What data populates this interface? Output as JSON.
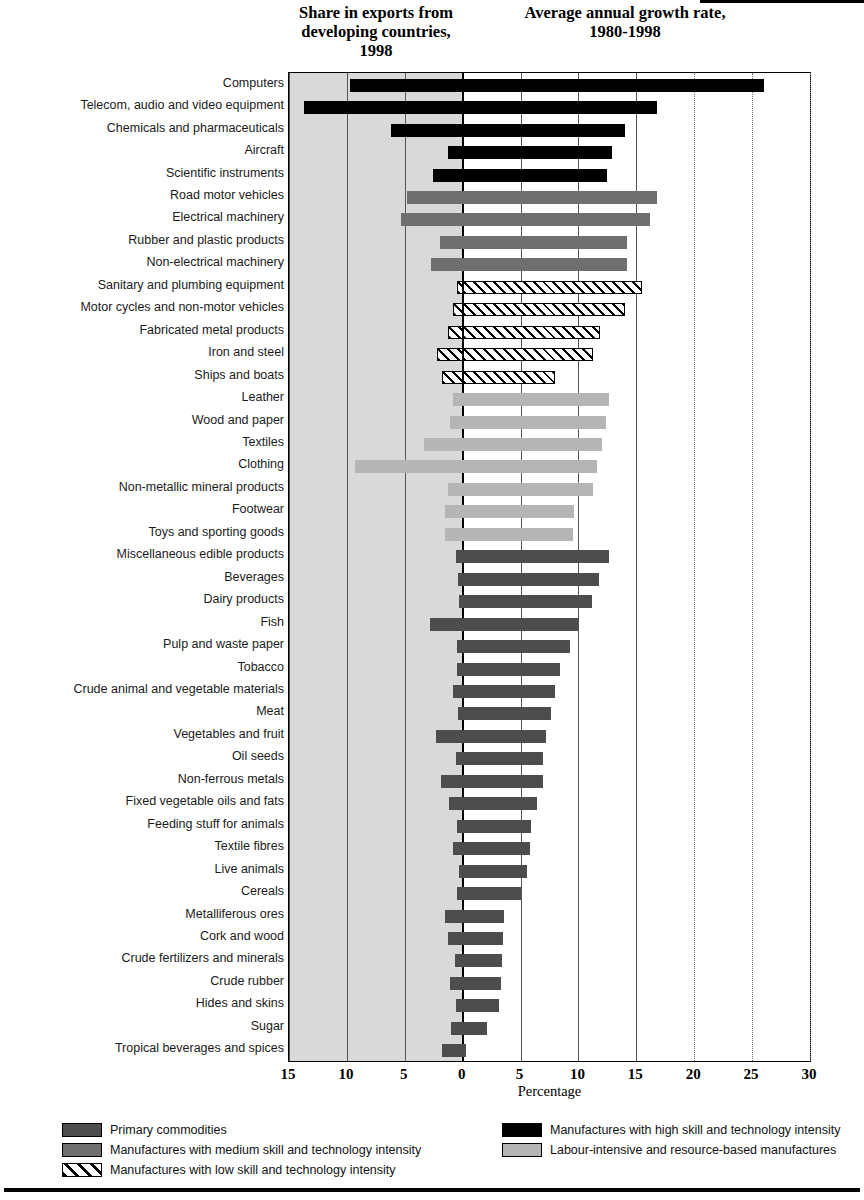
{
  "header": {
    "left_title": "Share in exports from developing countries, 1998",
    "right_title": "Average annual growth rate, 1980-1998"
  },
  "axis": {
    "x_title": "Percentage",
    "ticks": [
      "15",
      "10",
      "5",
      "0",
      "5",
      "10",
      "15",
      "20",
      "25",
      "30"
    ]
  },
  "legend": {
    "items": [
      {
        "label": "Primary commodities",
        "key": "primary",
        "color": "#4d4d4d"
      },
      {
        "label": "Manufactures with high skill and technology intensity",
        "key": "high",
        "color": "#000000"
      },
      {
        "label": "Manufactures with medium skill and technology intensity",
        "key": "medium",
        "color": "#6f6f6f"
      },
      {
        "label": "Labour-intensive and resource-based manufactures",
        "key": "labour",
        "color": "#b5b5b5"
      },
      {
        "label": "Manufactures with low skill and technology intensity",
        "key": "low",
        "color": "#ffffff"
      }
    ]
  },
  "chart_data": {
    "type": "bar",
    "orientation": "horizontal",
    "xlabel": "Percentage",
    "ylabel": "",
    "xlim": [
      -15,
      30
    ],
    "grid": true,
    "legend_position": "bottom",
    "note": "Bars extending left of 0 show share in exports (1998); bars extending right of 0 show average annual growth rate 1980-1998.",
    "categories": [
      "Computers",
      "Telecom, audio and video equipment",
      "Chemicals and pharmaceuticals",
      "Aircraft",
      "Scientific instruments",
      "Road motor vehicles",
      "Electrical machinery",
      "Rubber and plastic products",
      "Non-electrical machinery",
      "Sanitary and plumbing equipment",
      "Motor cycles and non-motor vehicles",
      "Fabricated metal products",
      "Iron and steel",
      "Ships and boats",
      "Leather",
      "Wood and paper",
      "Textiles",
      "Clothing",
      "Non-metallic mineral products",
      "Footwear",
      "Toys and sporting goods",
      "Miscellaneous edible products",
      "Beverages",
      "Dairy products",
      "Fish",
      "Pulp and waste paper",
      "Tobacco",
      "Crude animal and vegetable materials",
      "Meat",
      "Vegetables and fruit",
      "Oil seeds",
      "Non-ferrous metals",
      "Fixed vegetable oils and fats",
      "Feeding stuff for animals",
      "Textile fibres",
      "Live animals",
      "Cereals",
      "Metalliferous ores",
      "Cork and wood",
      "Crude fertilizers and minerals",
      "Crude rubber",
      "Hides and skins",
      "Sugar",
      "Tropical beverages and spices"
    ],
    "groups": [
      "high",
      "high",
      "high",
      "high",
      "high",
      "medium",
      "medium",
      "medium",
      "medium",
      "low",
      "low",
      "low",
      "low",
      "low",
      "labour",
      "labour",
      "labour",
      "labour",
      "labour",
      "labour",
      "labour",
      "primary",
      "primary",
      "primary",
      "primary",
      "primary",
      "primary",
      "primary",
      "primary",
      "primary",
      "primary",
      "primary",
      "primary",
      "primary",
      "primary",
      "primary",
      "primary",
      "primary",
      "primary",
      "primary",
      "primary",
      "primary",
      "primary",
      "primary"
    ],
    "series": [
      {
        "name": "Share in exports from developing countries, 1998",
        "units": "percent",
        "values": [
          9.7,
          13.7,
          6.2,
          1.3,
          2.6,
          4.8,
          5.3,
          2.0,
          2.7,
          0.5,
          0.8,
          1.3,
          2.2,
          1.8,
          0.8,
          1.1,
          3.3,
          9.3,
          1.3,
          1.5,
          1.5,
          0.6,
          0.4,
          0.3,
          2.8,
          0.5,
          0.5,
          0.8,
          0.4,
          2.3,
          0.6,
          1.9,
          1.2,
          0.5,
          0.8,
          0.3,
          0.5,
          1.5,
          1.3,
          0.7,
          1.1,
          0.6,
          1.0,
          1.8
        ]
      },
      {
        "name": "Average annual growth rate, 1980-1998",
        "units": "percent",
        "values": [
          26.0,
          16.8,
          14.0,
          12.9,
          12.5,
          16.8,
          16.2,
          14.2,
          14.2,
          15.5,
          14.0,
          11.9,
          11.3,
          8.0,
          12.6,
          12.4,
          12.0,
          11.6,
          11.3,
          9.6,
          9.5,
          12.6,
          11.8,
          11.2,
          10.0,
          9.3,
          8.4,
          8.0,
          7.6,
          7.2,
          6.9,
          6.9,
          6.4,
          5.9,
          5.8,
          5.6,
          5.0,
          3.6,
          3.5,
          3.4,
          3.3,
          3.1,
          2.1,
          0.3
        ]
      }
    ]
  }
}
